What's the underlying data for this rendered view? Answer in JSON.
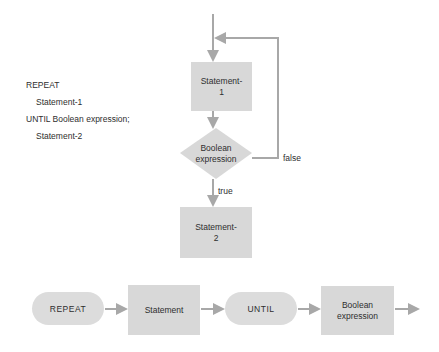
{
  "code": {
    "lines": [
      "REPEAT",
      "Statement-1",
      "UNTIL Boolean expression;",
      "Statement-2"
    ]
  },
  "flowchart": {
    "statement1": {
      "line1": "Statement-",
      "line2": "1"
    },
    "condition": {
      "line1": "Boolean",
      "line2": "expression"
    },
    "statement2": {
      "line1": "Statement-",
      "line2": "2"
    },
    "false_label": "false",
    "true_label": "true"
  },
  "syntax_diagram": {
    "repeat": "REPEAT",
    "statement": "Statement",
    "until": "UNTIL",
    "boolean": {
      "line1": "Boolean",
      "line2": "expression"
    }
  },
  "colors": {
    "node_fill": "#d8d8d8",
    "arrow": "#a8a8a8",
    "text": "#2e2e2e"
  }
}
